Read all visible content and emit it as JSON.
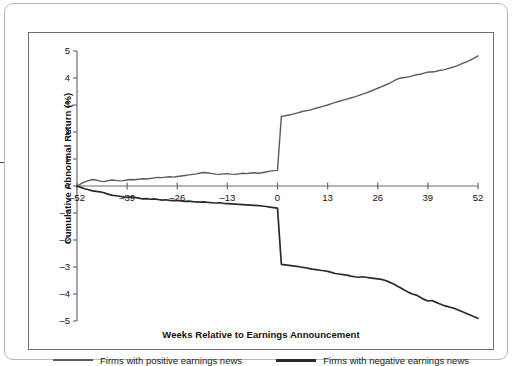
{
  "chart_data": {
    "type": "line",
    "title": "",
    "xlabel": "Weeks Relative to Earnings Announcement",
    "ylabel": "Cumulative Abnormal Return (%)",
    "xlim": [
      -52,
      52
    ],
    "ylim": [
      -5,
      5
    ],
    "grid": false,
    "legend_position": "bottom",
    "xticks": [
      -52,
      -39,
      -26,
      -13,
      0,
      13,
      26,
      39,
      52
    ],
    "xtick_labels": [
      "–52",
      "–39",
      "–26",
      "–13",
      "0",
      "13",
      "26",
      "39",
      "52"
    ],
    "yticks": [
      5,
      4,
      3,
      2,
      1,
      0,
      -1,
      -2,
      -3,
      -4,
      -5
    ],
    "ytick_labels": [
      "5",
      "4",
      "3",
      "2",
      "1",
      "0",
      "–1",
      "–2",
      "–3",
      "–4",
      "–5"
    ],
    "colors": {
      "positive_series": "#5c5c5c",
      "negative_series": "#2b2b2b",
      "axis": "#6d6d6d",
      "frame": "#6d6d6d",
      "card_border": "#b9b9b9",
      "text": "#111111",
      "background": "#ffffff"
    },
    "series": [
      {
        "name": "Firms with positive earnings news",
        "color": "#5c5c5c",
        "x": [
          -52,
          -51,
          -50,
          -49,
          -48,
          -47,
          -46,
          -45,
          -44,
          -43,
          -42,
          -41,
          -40,
          -39,
          -38,
          -37,
          -36,
          -35,
          -34,
          -33,
          -32,
          -31,
          -30,
          -29,
          -28,
          -27,
          -26,
          -25,
          -24,
          -23,
          -22,
          -21,
          -20,
          -19,
          -18,
          -17,
          -16,
          -15,
          -14,
          -13,
          -12,
          -11,
          -10,
          -9,
          -8,
          -7,
          -6,
          -5,
          -4,
          -3,
          -2,
          -1,
          0,
          1,
          2,
          3,
          4,
          5,
          6,
          7,
          8,
          9,
          10,
          11,
          12,
          13,
          14,
          15,
          16,
          17,
          18,
          19,
          20,
          21,
          22,
          23,
          24,
          25,
          26,
          27,
          28,
          29,
          30,
          31,
          32,
          33,
          34,
          35,
          36,
          37,
          38,
          39,
          40,
          41,
          42,
          43,
          44,
          45,
          46,
          47,
          48,
          49,
          50,
          51,
          52
        ],
        "values": [
          0.0,
          0.08,
          0.15,
          0.2,
          0.24,
          0.22,
          0.18,
          0.16,
          0.2,
          0.22,
          0.21,
          0.19,
          0.2,
          0.22,
          0.24,
          0.23,
          0.25,
          0.27,
          0.26,
          0.28,
          0.3,
          0.32,
          0.31,
          0.33,
          0.34,
          0.33,
          0.35,
          0.37,
          0.39,
          0.41,
          0.43,
          0.45,
          0.48,
          0.5,
          0.48,
          0.46,
          0.44,
          0.43,
          0.45,
          0.46,
          0.44,
          0.43,
          0.45,
          0.47,
          0.46,
          0.48,
          0.49,
          0.47,
          0.49,
          0.52,
          0.55,
          0.57,
          0.58,
          2.58,
          2.6,
          2.63,
          2.66,
          2.7,
          2.74,
          2.78,
          2.8,
          2.84,
          2.88,
          2.92,
          2.96,
          3.0,
          3.05,
          3.1,
          3.14,
          3.18,
          3.22,
          3.26,
          3.3,
          3.35,
          3.4,
          3.45,
          3.5,
          3.56,
          3.62,
          3.68,
          3.74,
          3.8,
          3.88,
          3.96,
          4.0,
          4.02,
          4.04,
          4.08,
          4.12,
          4.14,
          4.18,
          4.22,
          4.22,
          4.24,
          4.28,
          4.3,
          4.34,
          4.38,
          4.42,
          4.48,
          4.54,
          4.6,
          4.66,
          4.74,
          4.82
        ]
      },
      {
        "name": "Firms with negative earnings news",
        "color": "#2b2b2b",
        "x": [
          -52,
          -51,
          -50,
          -49,
          -48,
          -47,
          -46,
          -45,
          -44,
          -43,
          -42,
          -41,
          -40,
          -39,
          -38,
          -37,
          -36,
          -35,
          -34,
          -33,
          -32,
          -31,
          -30,
          -29,
          -28,
          -27,
          -26,
          -25,
          -24,
          -23,
          -22,
          -21,
          -20,
          -19,
          -18,
          -17,
          -16,
          -15,
          -14,
          -13,
          -12,
          -11,
          -10,
          -9,
          -8,
          -7,
          -6,
          -5,
          -4,
          -3,
          -2,
          -1,
          0,
          1,
          2,
          3,
          4,
          5,
          6,
          7,
          8,
          9,
          10,
          11,
          12,
          13,
          14,
          15,
          16,
          17,
          18,
          19,
          20,
          21,
          22,
          23,
          24,
          25,
          26,
          27,
          28,
          29,
          30,
          31,
          32,
          33,
          34,
          35,
          36,
          37,
          38,
          39,
          40,
          41,
          42,
          43,
          44,
          45,
          46,
          47,
          48,
          49,
          50,
          51,
          52
        ],
        "values": [
          0.0,
          -0.05,
          -0.1,
          -0.14,
          -0.18,
          -0.2,
          -0.22,
          -0.25,
          -0.3,
          -0.34,
          -0.36,
          -0.38,
          -0.4,
          -0.42,
          -0.4,
          -0.42,
          -0.45,
          -0.48,
          -0.47,
          -0.49,
          -0.48,
          -0.5,
          -0.52,
          -0.51,
          -0.53,
          -0.54,
          -0.53,
          -0.55,
          -0.57,
          -0.56,
          -0.58,
          -0.59,
          -0.6,
          -0.59,
          -0.61,
          -0.62,
          -0.63,
          -0.62,
          -0.64,
          -0.65,
          -0.66,
          -0.67,
          -0.68,
          -0.69,
          -0.7,
          -0.71,
          -0.72,
          -0.73,
          -0.74,
          -0.76,
          -0.78,
          -0.8,
          -0.82,
          -2.9,
          -2.92,
          -2.94,
          -2.96,
          -2.98,
          -3.0,
          -3.02,
          -3.05,
          -3.08,
          -3.1,
          -3.12,
          -3.14,
          -3.16,
          -3.2,
          -3.24,
          -3.26,
          -3.28,
          -3.3,
          -3.34,
          -3.36,
          -3.38,
          -3.36,
          -3.38,
          -3.4,
          -3.42,
          -3.44,
          -3.46,
          -3.5,
          -3.56,
          -3.62,
          -3.7,
          -3.78,
          -3.86,
          -3.94,
          -4.0,
          -4.04,
          -4.12,
          -4.2,
          -4.26,
          -4.24,
          -4.3,
          -4.36,
          -4.42,
          -4.46,
          -4.5,
          -4.54,
          -4.6,
          -4.66,
          -4.72,
          -4.78,
          -4.84,
          -4.9
        ]
      }
    ]
  },
  "legend": {
    "positive_label": "Firms with positive earnings news",
    "negative_label": "Firms with negative earnings news"
  },
  "axis_titles": {
    "x": "Weeks Relative to Earnings Announcement",
    "y": "Cumulative Abnormal Return (%)"
  }
}
